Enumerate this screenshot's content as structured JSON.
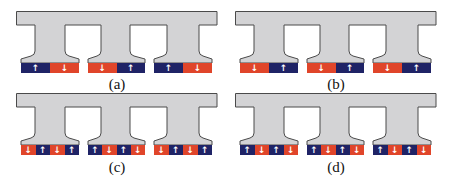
{
  "colors": {
    "iron_fill": "#d3d3d5",
    "iron_stroke": "#4a4a4a",
    "magnet_north_up": "#1f2366",
    "magnet_south_down": "#e0452a",
    "arrow": "#ffffff"
  },
  "legend_note": "Blue magnet = arrow up, Red magnet = arrow down",
  "panels": [
    {
      "label": "(a)",
      "teeth": [
        {
          "magnets": [
            {
              "dir": "up",
              "arrow": "↑"
            },
            {
              "dir": "down",
              "arrow": "↓"
            }
          ]
        },
        {
          "magnets": [
            {
              "dir": "down",
              "arrow": "↓"
            },
            {
              "dir": "up",
              "arrow": "↑"
            }
          ]
        },
        {
          "magnets": [
            {
              "dir": "up",
              "arrow": "↑"
            },
            {
              "dir": "down",
              "arrow": "↓"
            }
          ]
        }
      ]
    },
    {
      "label": "(b)",
      "teeth": [
        {
          "magnets": [
            {
              "dir": "down",
              "arrow": "↓"
            },
            {
              "dir": "up",
              "arrow": "↑"
            }
          ]
        },
        {
          "magnets": [
            {
              "dir": "down",
              "arrow": "↓"
            },
            {
              "dir": "up",
              "arrow": "↑"
            }
          ]
        },
        {
          "magnets": [
            {
              "dir": "down",
              "arrow": "↓"
            },
            {
              "dir": "up",
              "arrow": "↑"
            }
          ]
        }
      ]
    },
    {
      "label": "(c)",
      "teeth": [
        {
          "magnets": [
            {
              "dir": "down",
              "arrow": "↓"
            },
            {
              "dir": "up",
              "arrow": "↑"
            },
            {
              "dir": "down",
              "arrow": "↓"
            },
            {
              "dir": "up",
              "arrow": "↑"
            }
          ]
        },
        {
          "magnets": [
            {
              "dir": "up",
              "arrow": "↑"
            },
            {
              "dir": "down",
              "arrow": "↓"
            },
            {
              "dir": "up",
              "arrow": "↑"
            },
            {
              "dir": "down",
              "arrow": "↓"
            }
          ]
        },
        {
          "magnets": [
            {
              "dir": "down",
              "arrow": "↓"
            },
            {
              "dir": "up",
              "arrow": "↑"
            },
            {
              "dir": "down",
              "arrow": "↓"
            },
            {
              "dir": "up",
              "arrow": "↑"
            }
          ]
        }
      ]
    },
    {
      "label": "(d)",
      "teeth": [
        {
          "magnets": [
            {
              "dir": "up",
              "arrow": "↑"
            },
            {
              "dir": "down",
              "arrow": "↓"
            },
            {
              "dir": "up",
              "arrow": "↑"
            },
            {
              "dir": "down",
              "arrow": "↓"
            }
          ]
        },
        {
          "magnets": [
            {
              "dir": "up",
              "arrow": "↑"
            },
            {
              "dir": "down",
              "arrow": "↓"
            },
            {
              "dir": "up",
              "arrow": "↑"
            },
            {
              "dir": "down",
              "arrow": "↓"
            }
          ]
        },
        {
          "magnets": [
            {
              "dir": "up",
              "arrow": "↑"
            },
            {
              "dir": "down",
              "arrow": "↓"
            },
            {
              "dir": "up",
              "arrow": "↑"
            },
            {
              "dir": "down",
              "arrow": "↓"
            }
          ]
        }
      ]
    }
  ]
}
